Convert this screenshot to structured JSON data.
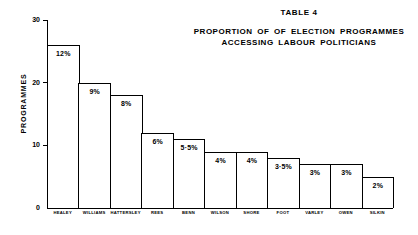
{
  "title": {
    "table_number": "TABLE 4",
    "heading_line1": "PROPORTION OF OF ELECTION PROGRAMMES",
    "heading_line2": "ACCESSING LABOUR POLITICIANS"
  },
  "chart_data": {
    "type": "bar",
    "title": "PROPORTION OF OF ELECTION PROGRAMMES ACCESSING LABOUR POLITICIANS",
    "subtitle": "TABLE 4",
    "xlabel": "",
    "ylabel": "PROGRAMMES",
    "ylim": [
      0,
      30
    ],
    "yticks": [
      "0",
      "10",
      "20",
      "30"
    ],
    "ytick_values": [
      0,
      10,
      20,
      30
    ],
    "grid": false,
    "legend": false,
    "categories": [
      "HEALEY",
      "WILLIAMS",
      "HATTERSLEY",
      "REES",
      "BENN",
      "WILSON",
      "SHORE",
      "FOOT",
      "VARLEY",
      "OWEN",
      "SILKIN"
    ],
    "values": [
      26,
      20,
      18,
      12,
      11,
      9,
      9,
      8,
      7,
      7,
      5
    ],
    "data_labels": [
      "12%",
      "9%",
      "8%",
      "6%",
      "5·5%",
      "4%",
      "4%",
      "3·5%",
      "3%",
      "3%",
      "2%"
    ],
    "percent_values": [
      12,
      9,
      8,
      6,
      5.5,
      4,
      4,
      3.5,
      3,
      3,
      2
    ]
  },
  "axis": {
    "y_title": "PROGRAMMES"
  }
}
